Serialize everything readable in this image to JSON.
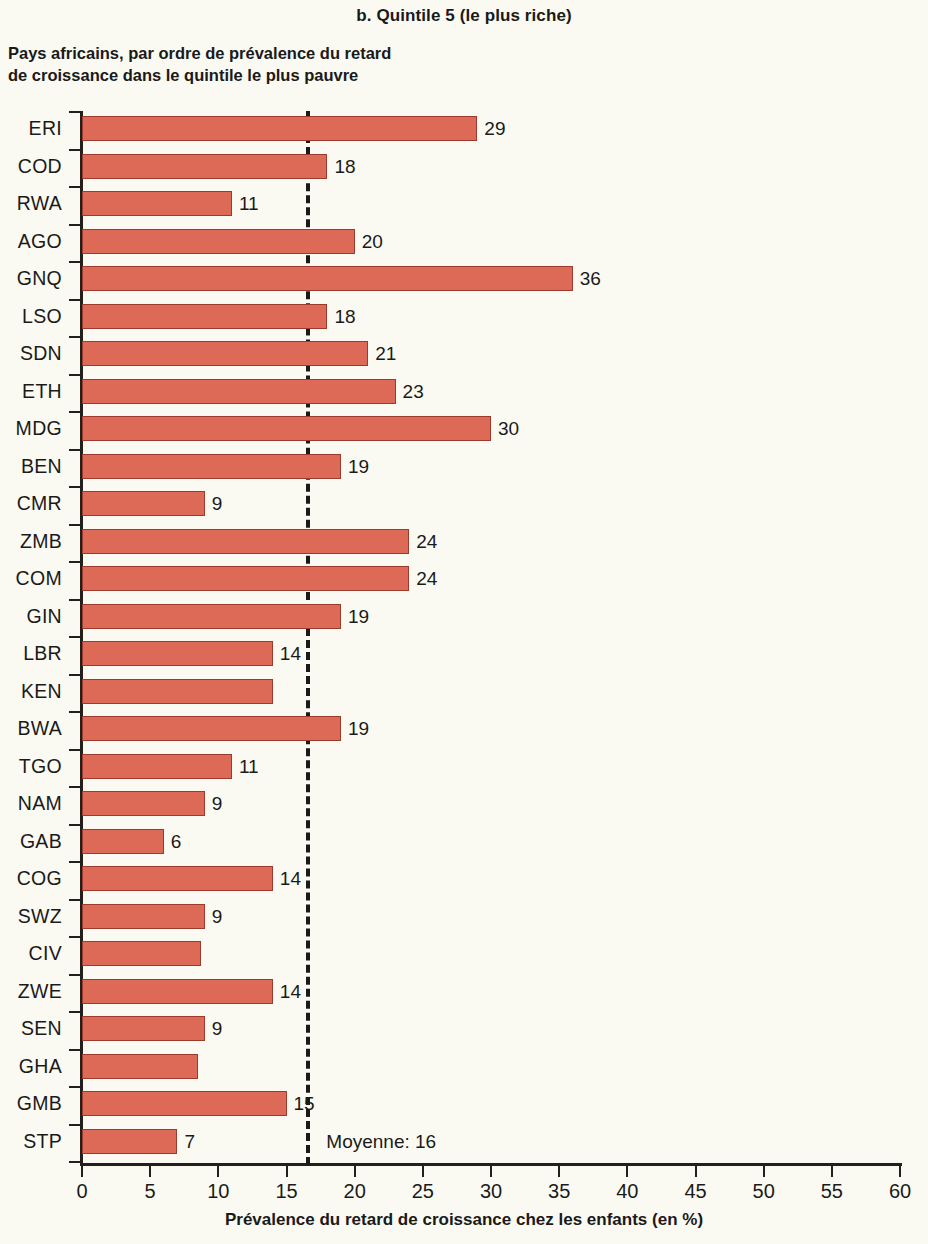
{
  "panel_title": "b. Quintile 5 (le plus riche)",
  "subtitle": "Pays africains, par ordre de prévalence du retard\nde croissance dans le quintile  le plus pauvre",
  "x_axis_title": "Prévalence du retard de croissance chez les enfants (en %)",
  "average_label": "Moyenne: 16",
  "colors": {
    "bar_fill": "#DD6A56",
    "bar_stroke": "#9C3B2C",
    "background": "#FBFAF2",
    "axis": "#231F1B",
    "text": "#1A1A1A"
  },
  "chart_data": {
    "type": "bar",
    "orientation": "horizontal",
    "title": "b. Quintile 5 (le plus riche)",
    "subtitle": "Pays africains, par ordre de prévalence du retard de croissance dans le quintile  le plus pauvre",
    "xlabel": "Prévalence du retard de croissance chez les enfants (en %)",
    "ylabel": "",
    "xlim": [
      0,
      60
    ],
    "xticks": [
      0,
      5,
      10,
      15,
      20,
      25,
      30,
      35,
      40,
      45,
      50,
      55,
      60
    ],
    "grid": false,
    "legend": null,
    "average_line": 16.6,
    "average_annotation": "Moyenne: 16",
    "categories": [
      "ERI",
      "COD",
      "RWA",
      "AGO",
      "GNQ",
      "LSO",
      "SDN",
      "ETH",
      "MDG",
      "BEN",
      "CMR",
      "ZMB",
      "COM",
      "GIN",
      "LBR",
      "KEN",
      "BWA",
      "TGO",
      "NAM",
      "GAB",
      "COG",
      "SWZ",
      "CIV",
      "ZWE",
      "SEN",
      "GHA",
      "GMB",
      "STP"
    ],
    "values": [
      29,
      18,
      11,
      20,
      36,
      18,
      21,
      23,
      30,
      19,
      9,
      24,
      24,
      19,
      14,
      14,
      19,
      11,
      9,
      6,
      14,
      9,
      8.7,
      14,
      9,
      8.5,
      15,
      7
    ],
    "data_labels": [
      "29",
      "18",
      "11",
      "20",
      "36",
      "18",
      "21",
      "23",
      "30",
      "19",
      "9",
      "24",
      "24",
      "19",
      "14",
      "",
      "19",
      "11",
      "9",
      "6",
      "14",
      "9",
      "",
      "14",
      "9",
      "",
      "15",
      "7"
    ]
  }
}
